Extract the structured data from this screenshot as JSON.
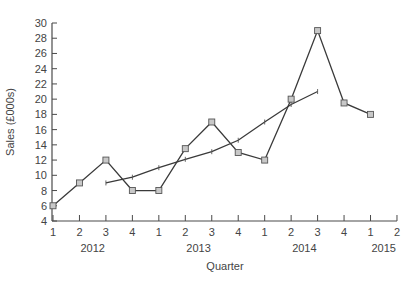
{
  "chart_data": {
    "type": "line",
    "title": "",
    "xlabel": "Quarter",
    "ylabel": "Sales (£000s)",
    "ylim": [
      4,
      30
    ],
    "yticks": [
      4,
      6,
      8,
      10,
      12,
      14,
      16,
      18,
      20,
      22,
      24,
      26,
      28,
      30
    ],
    "x_tick_labels": [
      "1",
      "2",
      "3",
      "4",
      "1",
      "2",
      "3",
      "4",
      "1",
      "2",
      "3",
      "4",
      "1",
      "2"
    ],
    "year_labels": [
      {
        "label": "2012",
        "center_index": 1.5
      },
      {
        "label": "2013",
        "center_index": 5.5
      },
      {
        "label": "2014",
        "center_index": 9.5
      },
      {
        "label": "2015",
        "center_index": 12.5
      }
    ],
    "grid": false,
    "legend": null,
    "series": [
      {
        "name": "Sales",
        "marker": "square",
        "x_index": [
          0,
          1,
          2,
          3,
          4,
          5,
          6,
          7,
          8,
          9,
          10,
          11,
          12
        ],
        "values": [
          6,
          9,
          12,
          8,
          8,
          13.5,
          17,
          13,
          12,
          20,
          29,
          19.5,
          18
        ]
      },
      {
        "name": "Moving average",
        "marker": "tick",
        "x_index": [
          2,
          3,
          4,
          5,
          6,
          7,
          8,
          9,
          10
        ],
        "values": [
          9,
          9.75,
          11,
          12.1,
          13.1,
          14.6,
          17,
          19.3,
          21
        ]
      }
    ]
  }
}
